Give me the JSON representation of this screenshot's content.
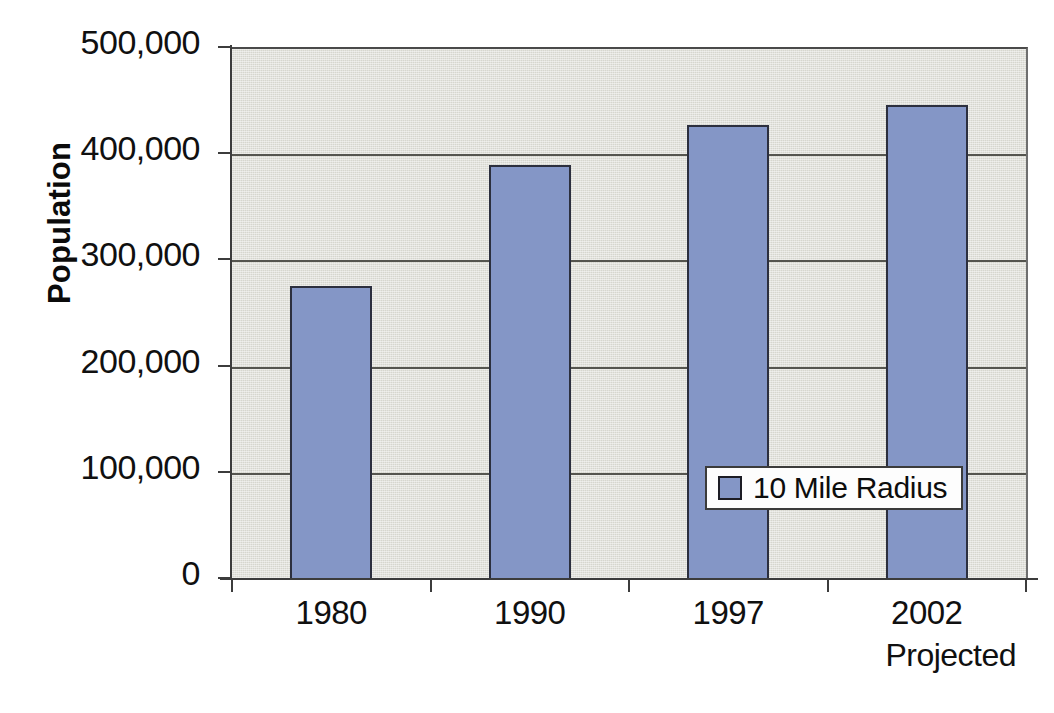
{
  "chart_data": {
    "type": "bar",
    "title": "",
    "xlabel": "",
    "ylabel": "Population",
    "ylim": [
      0,
      500000
    ],
    "grid": true,
    "legend_position": "inside-center-right",
    "categories": [
      "1980",
      "1990",
      "1997",
      "2002"
    ],
    "category_sublabels": [
      "",
      "",
      "",
      "Projected"
    ],
    "series": [
      {
        "name": "10 Mile Radius",
        "color": "#8496c6",
        "values": [
          277000,
          391000,
          428000,
          447000
        ]
      }
    ],
    "ytick_labels": [
      "500,000",
      "400,000",
      "300,000",
      "200,000",
      "100,000",
      "0"
    ],
    "ytick_values": [
      500000,
      400000,
      300000,
      200000,
      100000,
      0
    ]
  },
  "axis": {
    "y_title": "Population",
    "y_ticks": [
      {
        "label": "500,000",
        "value": 500000
      },
      {
        "label": "400,000",
        "value": 400000
      },
      {
        "label": "300,000",
        "value": 300000
      },
      {
        "label": "200,000",
        "value": 200000
      },
      {
        "label": "100,000",
        "value": 100000
      },
      {
        "label": "0",
        "value": 0
      }
    ],
    "x_ticks": [
      {
        "label": "1980",
        "sublabel": ""
      },
      {
        "label": "1990",
        "sublabel": ""
      },
      {
        "label": "1997",
        "sublabel": ""
      },
      {
        "label": "2002",
        "sublabel": "Projected"
      }
    ]
  },
  "legend": {
    "entries": [
      {
        "label": "10 Mile Radius",
        "color": "#8496c6"
      }
    ]
  },
  "colors": {
    "bar_fill": "#8496c6",
    "bar_border": "#2c2f3e",
    "plot_background": "#d6d6ce",
    "gridline": "#55554f",
    "axis": "#3c3c3c",
    "text": "#101010",
    "page_background": "#ffffff"
  }
}
